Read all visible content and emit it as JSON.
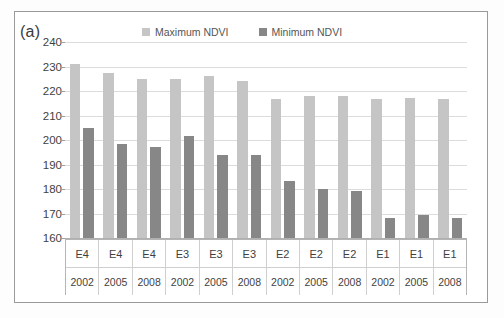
{
  "figure": {
    "panel_tag": "(a)",
    "border_color": "#9a9a9a"
  },
  "legend": {
    "position": "top-center",
    "items": [
      {
        "label": "Maximum NDVI",
        "color": "#c5c5c5",
        "name": "legend-maximum-ndvi"
      },
      {
        "label": "Minimum NDVI",
        "color": "#878787",
        "name": "legend-minimum-ndvi"
      }
    ]
  },
  "axis": {
    "y_ticks": [
      240,
      230,
      220,
      210,
      200,
      190,
      180,
      170,
      160
    ],
    "y_min": 160,
    "y_max": 240
  },
  "categories_site": [
    "E4",
    "E4",
    "E4",
    "E3",
    "E3",
    "E3",
    "E2",
    "E2",
    "E2",
    "E1",
    "E1",
    "E1"
  ],
  "categories_year": [
    "2002",
    "2005",
    "2008",
    "2002",
    "2005",
    "2008",
    "2002",
    "2005",
    "2008",
    "2002",
    "2005",
    "2008"
  ],
  "chart_data": {
    "type": "bar",
    "title": "(a)",
    "xlabel": "",
    "ylabel": "",
    "ylim": [
      160,
      240
    ],
    "grid": true,
    "legend_position": "top-center",
    "categories": [
      "E4 2002",
      "E4 2005",
      "E4 2008",
      "E3 2002",
      "E3 2005",
      "E3 2008",
      "E2 2002",
      "E2 2005",
      "E2 2008",
      "E1 2002",
      "E1 2005",
      "E1 2008"
    ],
    "series": [
      {
        "name": "Maximum NDVI",
        "color": "#c5c5c5",
        "values": [
          231.2,
          227.2,
          225.0,
          225.0,
          226.2,
          224.2,
          216.8,
          217.8,
          217.8,
          216.6,
          217.3,
          216.7
        ]
      },
      {
        "name": "Minimum NDVI",
        "color": "#878787",
        "values": [
          205.0,
          198.3,
          197.3,
          201.5,
          193.8,
          194.0,
          183.2,
          180.2,
          179.3,
          168.0,
          169.4,
          168.1
        ]
      }
    ]
  }
}
